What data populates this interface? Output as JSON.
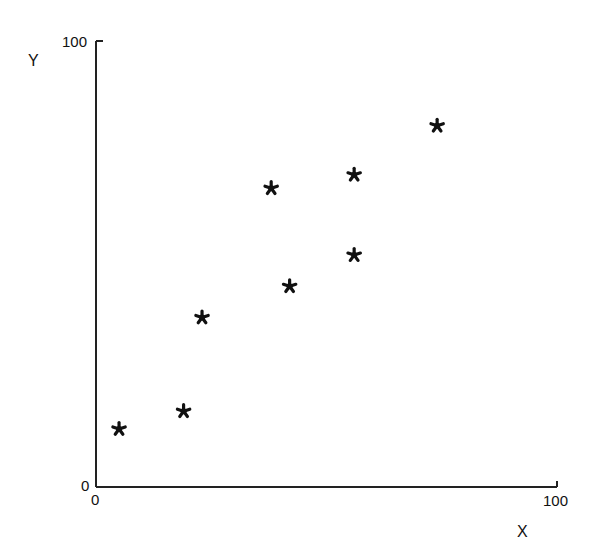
{
  "chart_data": {
    "type": "scatter",
    "title": "",
    "xlabel": "X",
    "ylabel": "Y",
    "xlim": [
      0,
      100
    ],
    "ylim": [
      0,
      100
    ],
    "grid": false,
    "legend": null,
    "marker": "asterisk",
    "x_ticks": [
      "0",
      "100"
    ],
    "y_ticks": [
      "0",
      "100"
    ],
    "points": [
      {
        "x": 5,
        "y": 13
      },
      {
        "x": 19,
        "y": 17
      },
      {
        "x": 23,
        "y": 38
      },
      {
        "x": 38,
        "y": 67
      },
      {
        "x": 42,
        "y": 45
      },
      {
        "x": 56,
        "y": 52
      },
      {
        "x": 56,
        "y": 70
      },
      {
        "x": 74,
        "y": 81
      }
    ]
  },
  "labels": {
    "y_axis": "Y",
    "x_axis": "X",
    "y_top": "100",
    "y_zero": "0",
    "x_zero": "0",
    "x_right": "100"
  }
}
